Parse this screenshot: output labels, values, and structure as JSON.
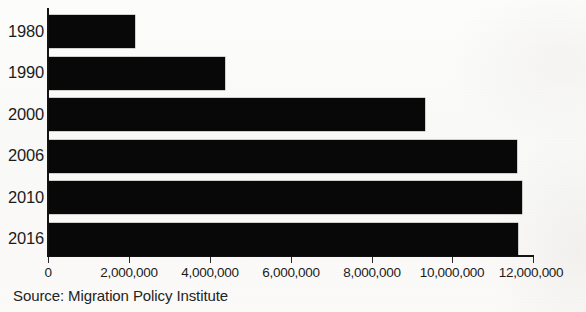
{
  "chart_data": {
    "type": "bar",
    "orientation": "horizontal",
    "title": "",
    "subtitle": "",
    "xlabel": "",
    "ylabel": "",
    "categories": [
      "1980",
      "1990",
      "2000",
      "2006",
      "2010",
      "2016"
    ],
    "values": [
      2130000,
      4360000,
      9300000,
      11580000,
      11710000,
      11600000
    ],
    "series": [
      {
        "name": "Population",
        "values": [
          2130000,
          4360000,
          9300000,
          11580000,
          11710000,
          11600000
        ]
      }
    ],
    "xlim": [
      0,
      12000000
    ],
    "xticks": [
      0,
      2000000,
      4000000,
      6000000,
      8000000,
      10000000,
      12000000
    ],
    "xtick_labels": [
      "0",
      "2,000,000",
      "4,000,000",
      "6,000,000",
      "8,000,000",
      "10,000,000",
      "12,000,000"
    ],
    "grid": false,
    "legend": false,
    "legend_position": "none",
    "bar_color": "#080808",
    "axis_color": "#141414",
    "text_color": "#1c1c1c",
    "background_color": "#fbfbfa"
  },
  "footer": {
    "source": "Source: Migration Policy Institute"
  }
}
